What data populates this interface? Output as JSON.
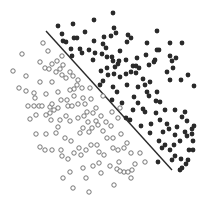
{
  "chart_data": {
    "type": "scatter",
    "title": "",
    "xlabel": "",
    "ylabel": "",
    "grid": false,
    "legend": null,
    "xlim": [
      0,
      203
    ],
    "ylim": [
      0,
      203
    ],
    "series": [
      {
        "name": "class-filled",
        "marker": "filled-circle",
        "color": "#2a2a2a",
        "points": [
          [
            113,
            13
          ],
          [
            58,
            26
          ],
          [
            73,
            24
          ],
          [
            94,
            20
          ],
          [
            114,
            28
          ],
          [
            116,
            33
          ],
          [
            111,
            36
          ],
          [
            104,
            37
          ],
          [
            128,
            35
          ],
          [
            157,
            31
          ],
          [
            127,
            42
          ],
          [
            131,
            38
          ],
          [
            62,
            34
          ],
          [
            63,
            41
          ],
          [
            74,
            38
          ],
          [
            77,
            38
          ],
          [
            85,
            32
          ],
          [
            66,
            42
          ],
          [
            94,
            41
          ],
          [
            106,
            48
          ],
          [
            103,
            44
          ],
          [
            120,
            51
          ],
          [
            147,
            43
          ],
          [
            159,
            50
          ],
          [
            146,
            55
          ],
          [
            170,
            43
          ],
          [
            182,
            43
          ],
          [
            71,
            49
          ],
          [
            80,
            49
          ],
          [
            89,
            50
          ],
          [
            72,
            56
          ],
          [
            82,
            53
          ],
          [
            95,
            53
          ],
          [
            102,
            54
          ],
          [
            107,
            57
          ],
          [
            112,
            57
          ],
          [
            113,
            61
          ],
          [
            119,
            61
          ],
          [
            93,
            60
          ],
          [
            101,
            71
          ],
          [
            115,
            67
          ],
          [
            107,
            68
          ],
          [
            120,
            77
          ],
          [
            133,
            66
          ],
          [
            136,
            66
          ],
          [
            139,
            68
          ],
          [
            149,
            65
          ],
          [
            155,
            60
          ],
          [
            157,
            50
          ],
          [
            170,
            56
          ],
          [
            172,
            61
          ],
          [
            176,
            58
          ],
          [
            173,
            68
          ],
          [
            167,
            72
          ],
          [
            154,
            62
          ],
          [
            103,
            81
          ],
          [
            114,
            74
          ],
          [
            126,
            74
          ],
          [
            131,
            72
          ],
          [
            136,
            73
          ],
          [
            143,
            79
          ],
          [
            150,
            82
          ],
          [
            147,
            92
          ],
          [
            149,
            96
          ],
          [
            157,
            92
          ],
          [
            170,
            80
          ],
          [
            181,
            80
          ],
          [
            188,
            75
          ],
          [
            194,
            86
          ],
          [
            100,
            85
          ],
          [
            113,
            87
          ],
          [
            117,
            92
          ],
          [
            127,
            85
          ],
          [
            138,
            87
          ],
          [
            134,
            97
          ],
          [
            138,
            103
          ],
          [
            156,
            101
          ],
          [
            160,
            102
          ],
          [
            165,
            110
          ],
          [
            160,
            120
          ],
          [
            175,
            110
          ],
          [
            185,
            112
          ],
          [
            156,
            113
          ],
          [
            143,
            109
          ],
          [
            133,
            110
          ],
          [
            122,
            103
          ],
          [
            112,
            100
          ],
          [
            126,
            118
          ],
          [
            130,
            120
          ],
          [
            145,
            112
          ],
          [
            151,
            124
          ],
          [
            150,
            133
          ],
          [
            159,
            141
          ],
          [
            163,
            132
          ],
          [
            169,
            129
          ],
          [
            177,
            127
          ],
          [
            182,
            117
          ],
          [
            187,
            121
          ],
          [
            185,
            132
          ],
          [
            192,
            129
          ],
          [
            193,
            141
          ],
          [
            187,
            136
          ],
          [
            165,
            145
          ],
          [
            170,
            150
          ],
          [
            175,
            156
          ],
          [
            181,
            159
          ],
          [
            174,
            145
          ],
          [
            189,
            150
          ],
          [
            180,
            170
          ],
          [
            193,
            150
          ],
          [
            186,
            164
          ],
          [
            158,
            162
          ],
          [
            172,
            160
          ],
          [
            182,
            168
          ],
          [
            188,
            160
          ],
          [
            141,
            126
          ],
          [
            167,
            124
          ],
          [
            194,
            126
          ],
          [
            175,
            135
          ],
          [
            162,
            148
          ],
          [
            180,
            141
          ],
          [
            192,
            134
          ],
          [
            118,
            64
          ],
          [
            126,
            60
          ],
          [
            137,
            58
          ],
          [
            108,
            75
          ],
          [
            145,
            85
          ]
        ]
      },
      {
        "name": "class-hollow",
        "marker": "open-circle",
        "color": "#666666",
        "points": [
          [
            43,
            43
          ],
          [
            22,
            54
          ],
          [
            48,
            51
          ],
          [
            40,
            62
          ],
          [
            52,
            64
          ],
          [
            45,
            68
          ],
          [
            49,
            69
          ],
          [
            57,
            61
          ],
          [
            62,
            56
          ],
          [
            60,
            69
          ],
          [
            63,
            65
          ],
          [
            56,
            72
          ],
          [
            62,
            75
          ],
          [
            13,
            71
          ],
          [
            26,
            76
          ],
          [
            40,
            82
          ],
          [
            52,
            82
          ],
          [
            19,
            88
          ],
          [
            35,
            98
          ],
          [
            34,
            106
          ],
          [
            39,
            106
          ],
          [
            70,
            72
          ],
          [
            66,
            78
          ],
          [
            73,
            76
          ],
          [
            78,
            80
          ],
          [
            77,
            85
          ],
          [
            74,
            89
          ],
          [
            70,
            90
          ],
          [
            82,
            88
          ],
          [
            90,
            88
          ],
          [
            74,
            96
          ],
          [
            67,
            100
          ],
          [
            83,
            98
          ],
          [
            28,
            106
          ],
          [
            42,
            106
          ],
          [
            50,
            107
          ],
          [
            52,
            104
          ],
          [
            58,
            108
          ],
          [
            61,
            100
          ],
          [
            68,
            106
          ],
          [
            72,
            106
          ],
          [
            78,
            104
          ],
          [
            85,
            104
          ],
          [
            87,
            112
          ],
          [
            54,
            110
          ],
          [
            50,
            113
          ],
          [
            30,
            119
          ],
          [
            36,
            115
          ],
          [
            46,
            115
          ],
          [
            51,
            120
          ],
          [
            60,
            120
          ],
          [
            66,
            116
          ],
          [
            70,
            121
          ],
          [
            78,
            118
          ],
          [
            84,
            116
          ],
          [
            93,
            113
          ],
          [
            96,
            108
          ],
          [
            101,
            116
          ],
          [
            96,
            121
          ],
          [
            88,
            122
          ],
          [
            92,
            128
          ],
          [
            83,
            128
          ],
          [
            89,
            132
          ],
          [
            98,
            125
          ],
          [
            106,
            122
          ],
          [
            111,
            126
          ],
          [
            103,
            131
          ],
          [
            107,
            138
          ],
          [
            113,
            138
          ],
          [
            121,
            134
          ],
          [
            56,
            133
          ],
          [
            58,
            127
          ],
          [
            80,
            133
          ],
          [
            65,
            138
          ],
          [
            71,
            141
          ],
          [
            36,
            134
          ],
          [
            46,
            134
          ],
          [
            40,
            147
          ],
          [
            45,
            150
          ],
          [
            52,
            150
          ],
          [
            61,
            150
          ],
          [
            62,
            156
          ],
          [
            68,
            159
          ],
          [
            74,
            153
          ],
          [
            79,
            148
          ],
          [
            81,
            155
          ],
          [
            86,
            150
          ],
          [
            91,
            145
          ],
          [
            97,
            145
          ],
          [
            99,
            152
          ],
          [
            104,
            155
          ],
          [
            113,
            148
          ],
          [
            118,
            150
          ],
          [
            124,
            148
          ],
          [
            127,
            143
          ],
          [
            131,
            153
          ],
          [
            140,
            153
          ],
          [
            110,
            166
          ],
          [
            117,
            169
          ],
          [
            124,
            172
          ],
          [
            128,
            172
          ],
          [
            132,
            170
          ],
          [
            70,
            172
          ],
          [
            63,
            178
          ],
          [
            73,
            188
          ],
          [
            86,
            178
          ],
          [
            83,
            168
          ],
          [
            131,
            178
          ],
          [
            120,
            171
          ],
          [
            114,
            185
          ],
          [
            89,
            192
          ],
          [
            101,
            173
          ],
          [
            99,
            163
          ],
          [
            93,
            166
          ],
          [
            26,
            91
          ],
          [
            58,
            92
          ],
          [
            46,
            94
          ],
          [
            34,
            93
          ],
          [
            119,
            162
          ],
          [
            135,
            164
          ],
          [
            145,
            162
          ],
          [
            91,
            99
          ],
          [
            103,
            96
          ],
          [
            112,
            112
          ],
          [
            118,
            118
          ],
          [
            120,
            108
          ]
        ]
      }
    ],
    "decision_boundary": {
      "type": "line",
      "color": "#2a2a2a",
      "from": [
        46,
        31
      ],
      "to": [
        172,
        170
      ]
    }
  }
}
